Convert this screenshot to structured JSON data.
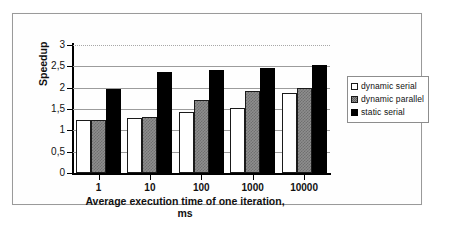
{
  "chart_data": {
    "type": "bar",
    "title": "",
    "xlabel": "Average execution time of one iteration, ms",
    "xlabel_line1": "Average execution time of one iteration,",
    "xlabel_line2": "ms",
    "ylabel": "Speedup",
    "categories": [
      "1",
      "10",
      "100",
      "1000",
      "10000"
    ],
    "series": [
      {
        "name": "dynamic serial",
        "values": [
          1.25,
          1.3,
          1.44,
          1.52,
          1.88
        ],
        "swatch": "white"
      },
      {
        "name": "dynamic parallel",
        "values": [
          1.25,
          1.32,
          1.72,
          1.92,
          2.0
        ],
        "swatch": "gray-pattern"
      },
      {
        "name": "static serial",
        "values": [
          1.97,
          2.37,
          2.42,
          2.45,
          2.52
        ],
        "swatch": "black"
      }
    ],
    "ylim": [
      0,
      3
    ],
    "ytick_labels": [
      "3",
      "2,5",
      "2",
      "1,5",
      "1",
      "0,5",
      "0"
    ],
    "ytick_values": [
      3,
      2.5,
      2,
      1.5,
      1,
      0.5,
      0
    ],
    "grid": "horizontal",
    "legend_position": "right",
    "legend_entries": [
      "dynamic serial",
      "dynamic parallel",
      "static serial"
    ],
    "colors": {
      "series_1": "#ffffff",
      "series_2": "#8e8e8e",
      "series_3": "#000000",
      "axis": "#000000",
      "gridline": "#9c9c9c",
      "frame": "#9a9a9a"
    }
  }
}
